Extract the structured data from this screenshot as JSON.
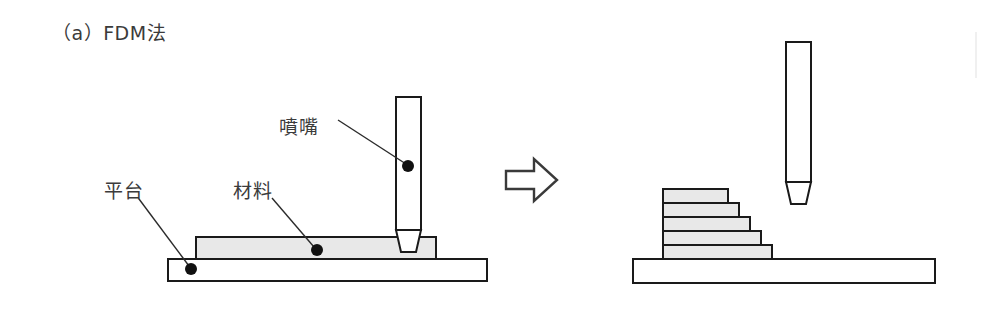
{
  "figure": {
    "caption": "（a）FDM法",
    "background_color": "#ffffff",
    "stroke_color": "#1a1a1a",
    "material_fill": "#e8e8e8",
    "platform_fill": "#ffffff",
    "text_color": "#3b3b3b",
    "width": 984,
    "height": 313
  },
  "labels": {
    "nozzle": "噴嘴",
    "material": "材料",
    "platform": "平台"
  },
  "left_scene": {
    "name": "initial-state",
    "nozzle": {
      "body": {
        "x": 396,
        "y": 97,
        "width": 25,
        "height": 133
      },
      "tip": {
        "top_width": 25,
        "bottom_width": 15,
        "height": 22
      },
      "callout_dot": {
        "x": 408,
        "y": 166
      }
    },
    "material_layer": {
      "x": 196,
      "y": 237,
      "width": 240,
      "height": 22,
      "callout_dot": {
        "x": 317,
        "y": 250
      }
    },
    "platform": {
      "x": 168,
      "y": 259,
      "width": 319,
      "height": 22,
      "callout_dot": {
        "x": 191,
        "y": 269
      }
    }
  },
  "arrow": {
    "name": "process-arrow",
    "direction": "right",
    "x": 505,
    "y": 158,
    "width": 52,
    "height": 44
  },
  "right_scene": {
    "name": "final-state",
    "nozzle": {
      "body": {
        "x": 786,
        "y": 42,
        "width": 25,
        "height": 140
      },
      "tip": {
        "top_width": 25,
        "bottom_width": 15,
        "height": 22
      }
    },
    "platform": {
      "x": 633,
      "y": 259,
      "width": 302,
      "height": 24
    },
    "layer_count": 5,
    "layers": [
      {
        "index": 1,
        "x": 663,
        "y": 245,
        "width": 109,
        "height": 14
      },
      {
        "index": 2,
        "x": 663,
        "y": 231,
        "width": 98,
        "height": 14
      },
      {
        "index": 3,
        "x": 663,
        "y": 217,
        "width": 87,
        "height": 14
      },
      {
        "index": 4,
        "x": 663,
        "y": 203,
        "width": 76,
        "height": 14
      },
      {
        "index": 5,
        "x": 663,
        "y": 189,
        "width": 65,
        "height": 14
      }
    ]
  }
}
